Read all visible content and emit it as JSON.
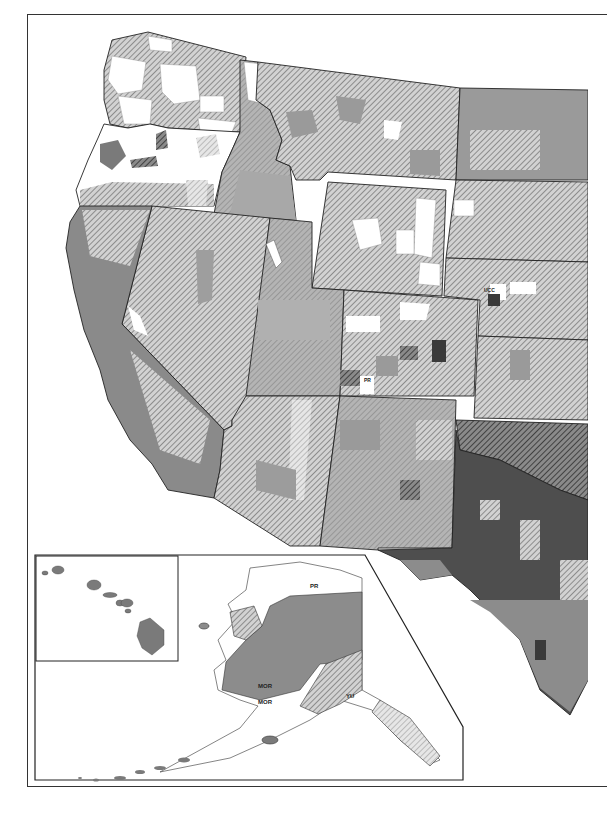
{
  "map": {
    "type": "choropleth",
    "subject": "United States counties (western half) with Alaska and Hawaii insets",
    "fill_classes": [
      {
        "name": "white",
        "color": "#ffffff"
      },
      {
        "name": "light-hatch",
        "color": "#c8c8c8"
      },
      {
        "name": "hatch",
        "color": "#9a9a9a"
      },
      {
        "name": "medium-gray",
        "color": "#8c8c8c"
      },
      {
        "name": "dark-hatch",
        "color": "#555555"
      },
      {
        "name": "dark-gray",
        "color": "#4a4a4a"
      }
    ],
    "colors": {
      "frame": "#333333",
      "state_border": "#222222",
      "background": "#ffffff"
    },
    "insets": {
      "hawaii": {
        "label": "Hawaii"
      },
      "alaska": {
        "labels": [
          {
            "code": "PR"
          },
          {
            "code": "MOR"
          },
          {
            "code": "MOR"
          },
          {
            "code": "YU"
          }
        ]
      }
    },
    "code_labels": [
      {
        "code": "UCC"
      },
      {
        "code": "PR"
      }
    ]
  }
}
